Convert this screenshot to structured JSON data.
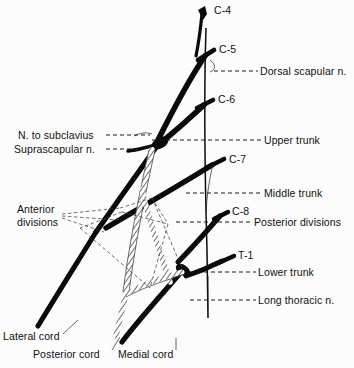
{
  "figure": {
    "background_color": "#fcfcfc",
    "ink_color": "#0a0a0a",
    "hatch_color": "#555555"
  },
  "roots": [
    {
      "id": "c4",
      "label": "C-4"
    },
    {
      "id": "c5",
      "label": "C-5"
    },
    {
      "id": "c6",
      "label": "C-6"
    },
    {
      "id": "c7",
      "label": "C-7"
    },
    {
      "id": "c8",
      "label": "C-8"
    },
    {
      "id": "t1",
      "label": "T-1"
    }
  ],
  "right_labels": [
    {
      "id": "dorsal-scapular",
      "label": "Dorsal scapular n."
    },
    {
      "id": "upper-trunk",
      "label": "Upper trunk"
    },
    {
      "id": "middle-trunk",
      "label": "Middle trunk"
    },
    {
      "id": "posterior-divisions",
      "label": "Posterior divisions"
    },
    {
      "id": "lower-trunk",
      "label": "Lower trunk"
    },
    {
      "id": "long-thoracic",
      "label": "Long thoracic n."
    }
  ],
  "left_labels": [
    {
      "id": "n-to-subclavius",
      "label": "N. to subclavius"
    },
    {
      "id": "suprascapular",
      "label": "Suprascapular n."
    },
    {
      "id": "anterior-divisions-line1",
      "label": "Anterior"
    },
    {
      "id": "anterior-divisions-line2",
      "label": "divisions"
    }
  ],
  "cord_labels": [
    {
      "id": "lateral-cord",
      "label": "Lateral cord"
    },
    {
      "id": "posterior-cord",
      "label": "Posterior cord"
    },
    {
      "id": "medial-cord",
      "label": "Medial cord"
    }
  ]
}
